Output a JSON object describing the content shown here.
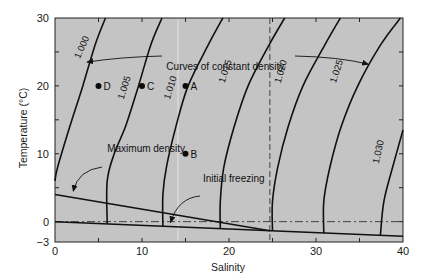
{
  "chart_data": {
    "type": "line",
    "title": "",
    "xlabel": "Salinity",
    "ylabel": "Temperature (°C)",
    "xlim": [
      0,
      40
    ],
    "ylim": [
      -3,
      30
    ],
    "grid": false,
    "legend": null,
    "x_ticks": [
      0,
      10,
      20,
      30,
      40
    ],
    "y_ticks": [
      -3,
      0,
      10,
      20,
      30
    ],
    "x_tick_labels": [
      "0",
      "10",
      "20",
      "30",
      "40"
    ],
    "y_tick_labels": [
      "−3",
      "0",
      "10",
      "20",
      "30"
    ],
    "background_color": "#c4c4c4",
    "density_curves": [
      {
        "label": "1.000",
        "points": [
          [
            5.8,
            30
          ],
          [
            4.6,
            26
          ],
          [
            3.2,
            20
          ],
          [
            1.7,
            14
          ],
          [
            0.3,
            8
          ],
          [
            0,
            6
          ]
        ],
        "label_pos": [
          3.4,
          25.5
        ],
        "label_angle": -66
      },
      {
        "label": "1.005",
        "points": [
          [
            12.3,
            30
          ],
          [
            11.0,
            26
          ],
          [
            9.6,
            20
          ],
          [
            8.1,
            14
          ],
          [
            6.8,
            10
          ],
          [
            6.0,
            6
          ],
          [
            6.0,
            -0.3
          ]
        ],
        "label_pos": [
          8.3,
          19.6
        ],
        "label_angle": -72
      },
      {
        "label": "1.010",
        "points": [
          [
            19.3,
            30
          ],
          [
            17.6,
            26
          ],
          [
            15.3,
            20
          ],
          [
            13.9,
            14
          ],
          [
            12.8,
            8
          ],
          [
            12.4,
            4
          ],
          [
            12.4,
            -0.7
          ]
        ],
        "label_pos": [
          13.6,
          19.6
        ],
        "label_angle": -72
      },
      {
        "label": "1.015",
        "points": [
          [
            26.4,
            30
          ],
          [
            24.6,
            26
          ],
          [
            22.2,
            20
          ],
          [
            20.6,
            14
          ],
          [
            19.4,
            8
          ],
          [
            19.0,
            3
          ],
          [
            19.0,
            -1.0
          ]
        ],
        "label_pos": [
          19.9,
          22.0
        ],
        "label_angle": -72
      },
      {
        "label": "1.020",
        "points": [
          [
            32.8,
            30
          ],
          [
            31.0,
            26
          ],
          [
            28.5,
            20
          ],
          [
            26.8,
            14
          ],
          [
            25.6,
            8
          ],
          [
            25.0,
            3
          ],
          [
            25.0,
            -1.35
          ]
        ],
        "label_pos": [
          26.3,
          22.0
        ],
        "label_angle": -74
      },
      {
        "label": "1.025",
        "points": [
          [
            39.7,
            30
          ],
          [
            37.4,
            26
          ],
          [
            34.8,
            20
          ],
          [
            32.9,
            14
          ],
          [
            31.6,
            8
          ],
          [
            30.9,
            3
          ],
          [
            30.9,
            -1.7
          ]
        ],
        "label_pos": [
          32.7,
          22.0
        ],
        "label_angle": -72
      },
      {
        "label": "1.030",
        "points": [
          [
            40,
            13.5
          ],
          [
            38.8,
            8
          ],
          [
            37.8,
            3
          ],
          [
            37.4,
            -2.0
          ]
        ],
        "label_pos": [
          37.5,
          10.2
        ],
        "label_angle": -78
      }
    ],
    "maximum_density_line": {
      "label": "Maximum density",
      "points": [
        [
          0,
          4.0
        ],
        [
          24.7,
          -1.33
        ]
      ]
    },
    "initial_freezing_line": {
      "label": "Initial freezing",
      "points": [
        [
          0,
          0
        ],
        [
          40,
          -2.15
        ]
      ]
    },
    "zero_reference_line": {
      "style": "dash-dot",
      "y": 0
    },
    "intersection_marker_line": {
      "style": "dashed",
      "x": 24.7
    },
    "points": [
      {
        "label": "A",
        "x": 15,
        "y": 20
      },
      {
        "label": "B",
        "x": 15,
        "y": 10
      },
      {
        "label": "C",
        "x": 10,
        "y": 20
      },
      {
        "label": "D",
        "x": 5,
        "y": 20
      }
    ],
    "annotations": [
      {
        "text": "Curves of constant density",
        "text_pos": [
          12.8,
          23.0
        ],
        "arrows_to": [
          [
            3.7,
            23.5
          ],
          [
            36.0,
            23.2
          ]
        ]
      },
      {
        "text": "Maximum density",
        "text_pos": [
          6.0,
          10.8
        ],
        "arrows_to": [
          [
            2.1,
            4.5
          ]
        ]
      },
      {
        "text": "Initial freezing",
        "text_pos": [
          17.0,
          6.5
        ],
        "arrows_to": [
          [
            13.3,
            -0.1
          ]
        ]
      }
    ]
  }
}
